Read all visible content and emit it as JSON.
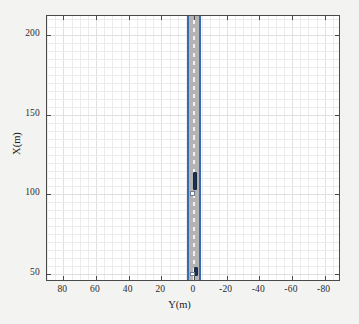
{
  "chart_data": {
    "type": "scatter",
    "title": "",
    "xlabel": "Y(m)",
    "ylabel": "X(m)",
    "xlim": [
      90,
      -90
    ],
    "ylim": [
      45,
      212
    ],
    "x_ticks": [
      80,
      60,
      40,
      20,
      0,
      -20,
      -40,
      -60,
      -80
    ],
    "x_tick_labels": [
      "80",
      "60",
      "40",
      "20",
      "0",
      "-20",
      "-40",
      "-60",
      "-80"
    ],
    "y_ticks": [
      50,
      100,
      150,
      200
    ],
    "y_tick_labels": [
      "50",
      "100",
      "150",
      "200"
    ],
    "x_axis_reversed": true,
    "grid": true,
    "legend": null,
    "series": [
      {
        "name": "road-surface",
        "type": "band",
        "orientation": "vertical",
        "center_y_m": 0,
        "half_width_m": 3.5,
        "color": "#b3b3b3"
      },
      {
        "name": "road-edge-left",
        "type": "line",
        "y_m": 3.7,
        "color": "#3a6bb0"
      },
      {
        "name": "road-edge-right",
        "type": "line",
        "y_m": -3.7,
        "color": "#3a6bb0"
      },
      {
        "name": "lane-marking-center",
        "type": "dashed-line",
        "y_m": 0,
        "color": "#f2f2f2"
      },
      {
        "name": "vehicles",
        "type": "rect-markers",
        "color": "#1b3055",
        "points": [
          {
            "label": "ego-vehicle",
            "x_m": 108.5,
            "y_m": -0.6,
            "length_m": 11.5,
            "width_m": 2.4
          },
          {
            "label": "target-vehicle",
            "x_m": 51.5,
            "y_m": -1.0,
            "length_m": 5.5,
            "width_m": 2.4
          }
        ]
      },
      {
        "name": "vehicle-reference-points",
        "type": "square-markers",
        "color": "#fbfbfb",
        "points": [
          {
            "label": "ego-reference",
            "x_m": 100.5,
            "y_m": 0.9
          },
          {
            "label": "target-reference",
            "x_m": 50.0,
            "y_m": 1.0
          }
        ]
      }
    ]
  },
  "axes": {
    "x_title": "Y(m)",
    "y_title": "X(m)",
    "x_tick_labels": [
      "80",
      "60",
      "40",
      "20",
      "0",
      "-20",
      "-40",
      "-60",
      "-80"
    ],
    "y_tick_labels": [
      "200",
      "150",
      "100",
      "50"
    ]
  },
  "colors": {
    "page_background": "#f3f3f2",
    "plot_background": "#ffffff",
    "axis_border": "#4a4a4a",
    "gridline": "#ececec",
    "road_fill": "#b3b3b3",
    "road_edge": "#3a6bb0",
    "lane_marking": "#f2f2f2",
    "vehicle": "#1b3055",
    "marker": "#fbfbfb",
    "tick_text": "#2b2b2b"
  }
}
